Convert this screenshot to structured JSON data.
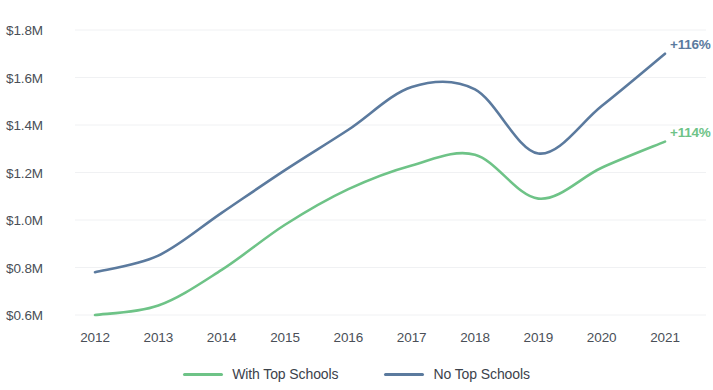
{
  "chart_data": {
    "type": "line",
    "title": "",
    "xlabel": "",
    "ylabel": "",
    "x": [
      2012,
      2013,
      2014,
      2015,
      2016,
      2017,
      2018,
      2019,
      2020,
      2021
    ],
    "x_tick_labels": [
      "2012",
      "2013",
      "2014",
      "2015",
      "2016",
      "2017",
      "2018",
      "2019",
      "2020",
      "2021"
    ],
    "y_tick_values": [
      1.8,
      1.6,
      1.4,
      1.2,
      1.0,
      0.8,
      0.6
    ],
    "y_tick_labels": [
      "$1.8M",
      "$1.6M",
      "$1.4M",
      "$1.2M",
      "$1.0M",
      "$0.8M",
      "$0.6M"
    ],
    "ylim": [
      0.6,
      1.8
    ],
    "xlim": [
      2012,
      2021
    ],
    "grid": true,
    "grid_axis": "y",
    "legend_position": "bottom",
    "series": [
      {
        "name": "With Top Schools",
        "color": "#6ec387",
        "values": [
          0.6,
          0.64,
          0.79,
          0.98,
          1.13,
          1.23,
          1.275,
          1.09,
          1.22,
          1.33
        ],
        "end_annotation": "+114%"
      },
      {
        "name": "No Top Schools",
        "color": "#5b7a9e",
        "values": [
          0.78,
          0.85,
          1.03,
          1.21,
          1.38,
          1.56,
          1.55,
          1.28,
          1.48,
          1.7
        ],
        "end_annotation": "+116%"
      }
    ],
    "annotations": [
      {
        "text": "+116%",
        "series": "No Top Schools",
        "color": "#5b7a9e"
      },
      {
        "text": "+114%",
        "series": "With Top Schools",
        "color": "#6ec387"
      }
    ]
  },
  "legend": {
    "items": [
      {
        "label": "With Top Schools",
        "color": "#6ec387"
      },
      {
        "label": "No Top Schools",
        "color": "#5b7a9e"
      }
    ]
  },
  "colors": {
    "background": "#ffffff",
    "grid": "#f0f1f3",
    "tick_text": "#4a4f57",
    "series_green": "#6ec387",
    "series_blue": "#5b7a9e"
  }
}
